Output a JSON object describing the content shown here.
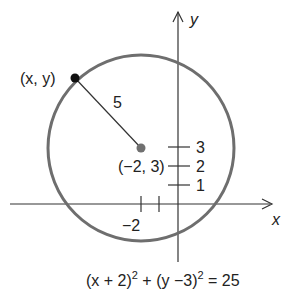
{
  "diagram": {
    "axes": {
      "x_label": "x",
      "y_label": "y"
    },
    "point_label": "(x, y)",
    "radius_label": "5",
    "center_label": "(−2, 3)",
    "y_ticks": [
      "3",
      "2",
      "1"
    ],
    "x_ticks": [
      "−2"
    ],
    "equation": {
      "part1": "(x + 2)",
      "exp1": "2",
      "part2": " + (y −3)",
      "exp2": "2",
      "part3": " = 25"
    },
    "colors": {
      "circle": "#6e6e6e",
      "center": "#707070",
      "point": "#111111",
      "axes": "#333333"
    }
  }
}
